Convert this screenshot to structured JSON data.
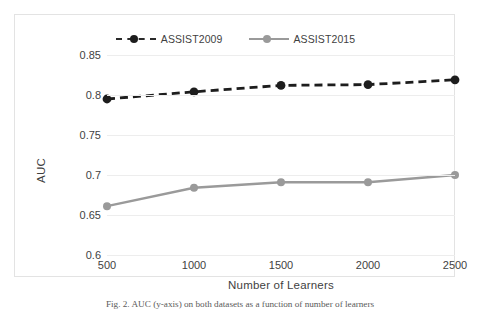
{
  "figure": {
    "caption": "Fig. 2.  AUC (y-axis) on both datasets as a function of number of learners"
  },
  "chart_data": {
    "type": "line",
    "title": "",
    "xlabel": "Number of Learners",
    "ylabel": "AUC",
    "categories": [
      "500",
      "1000",
      "1500",
      "2000",
      "2500"
    ],
    "x": [
      500,
      1000,
      1500,
      2000,
      2500
    ],
    "xlim": [
      500,
      2500
    ],
    "ylim": [
      0.6,
      0.85
    ],
    "yticks": [
      "0.85",
      "0.8",
      "0.75",
      "0.7",
      "0.65",
      "0.6"
    ],
    "ytick_values": [
      0.85,
      0.8,
      0.75,
      0.7,
      0.65,
      0.6
    ],
    "grid": true,
    "legend_position": "top-center",
    "series": [
      {
        "name": "ASSIST2009",
        "values": [
          0.795,
          0.804,
          0.812,
          0.813,
          0.819
        ],
        "color": "#1d1d1d",
        "line_style": "dashed",
        "marker": "circle"
      },
      {
        "name": "ASSIST2015",
        "values": [
          0.661,
          0.684,
          0.691,
          0.691,
          0.7
        ],
        "color": "#9a9a9a",
        "line_style": "solid",
        "marker": "circle"
      }
    ]
  }
}
